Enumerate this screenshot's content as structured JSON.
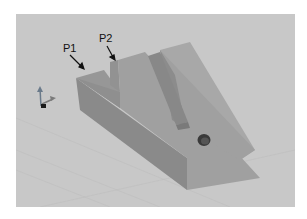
{
  "figure": {
    "type": "3d-cad-model",
    "labels": [
      {
        "id": "p1",
        "text": "P1"
      },
      {
        "id": "p2",
        "text": "P2"
      }
    ],
    "colors": {
      "background": "#c8c8c8",
      "face_top": "#9c9c9c",
      "face_side": "#8a8a8a",
      "face_slope": "#a2a2a2",
      "hole": "#3a3a3a"
    }
  }
}
